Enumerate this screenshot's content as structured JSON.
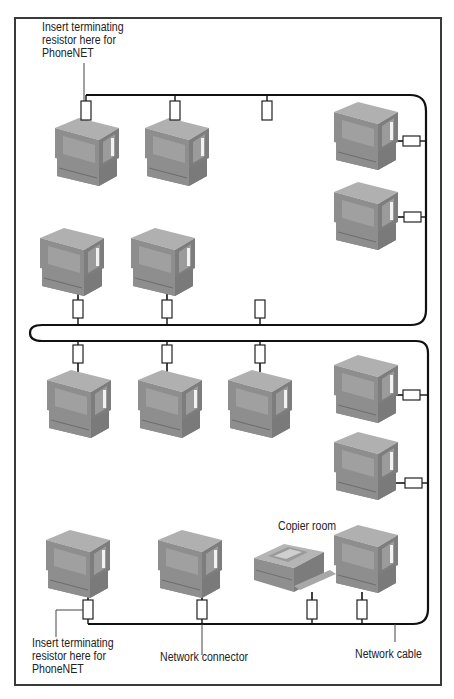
{
  "labels": {
    "top_resistor_note": "Insert terminating\nresistor here for\nPhoneNET",
    "bottom_resistor_note": "Insert terminating\nresistor here for\nPhoneNET",
    "network_connector": "Network connector",
    "network_cable": "Network cable",
    "copier_room": "Copier room"
  },
  "colors": {
    "cable": "#111111",
    "connector_fill": "#ffffff",
    "connector_stroke": "#222222",
    "computer_front": "#8e8e8e",
    "computer_top": "#b0b0b0",
    "computer_side": "#7a7a7a",
    "screen": "#a4a4a4",
    "frame": "#3a3a3a"
  },
  "network": {
    "computers": [
      {
        "id": "pc-1",
        "x": 55,
        "y": 118
      },
      {
        "id": "pc-2",
        "x": 145,
        "y": 118
      },
      {
        "id": "pc-3",
        "x": 338,
        "y": 102
      },
      {
        "id": "pc-4",
        "x": 338,
        "y": 182
      },
      {
        "id": "pc-5",
        "x": 40,
        "y": 228
      },
      {
        "id": "pc-6",
        "x": 131,
        "y": 228
      },
      {
        "id": "pc-7",
        "x": 47,
        "y": 370
      },
      {
        "id": "pc-8",
        "x": 138,
        "y": 370
      },
      {
        "id": "pc-9",
        "x": 228,
        "y": 370
      },
      {
        "id": "pc-10",
        "x": 336,
        "y": 355
      },
      {
        "id": "pc-11",
        "x": 336,
        "y": 432
      },
      {
        "id": "pc-12",
        "x": 46,
        "y": 532
      },
      {
        "id": "pc-13",
        "x": 158,
        "y": 532
      },
      {
        "id": "pc-14",
        "x": 336,
        "y": 527
      }
    ],
    "printer": {
      "id": "copier",
      "x": 254,
      "y": 540
    },
    "connectors_vertical": [
      {
        "x": 86,
        "y": 101
      },
      {
        "x": 175,
        "y": 101
      },
      {
        "x": 267,
        "y": 101
      },
      {
        "x": 78,
        "y": 302
      },
      {
        "x": 167,
        "y": 302
      },
      {
        "x": 260,
        "y": 302
      },
      {
        "x": 78,
        "y": 346
      },
      {
        "x": 167,
        "y": 346
      },
      {
        "x": 260,
        "y": 346
      },
      {
        "x": 88,
        "y": 600
      },
      {
        "x": 202,
        "y": 600
      },
      {
        "x": 312,
        "y": 600
      },
      {
        "x": 362,
        "y": 600
      }
    ],
    "connectors_horizontal": [
      {
        "x": 411,
        "y": 141
      },
      {
        "x": 412,
        "y": 217
      },
      {
        "x": 411,
        "y": 395
      },
      {
        "x": 413,
        "y": 483
      }
    ]
  }
}
